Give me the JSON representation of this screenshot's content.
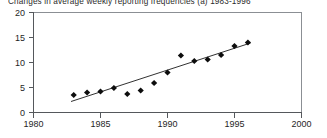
{
  "chart_data": {
    "type": "scatter",
    "title": "Changes in average weekly reporting frequencies (a) 1983-1996",
    "xlabel": "",
    "ylabel": "",
    "xlim": [
      1980,
      2000
    ],
    "ylim": [
      0,
      20
    ],
    "x_ticks": [
      1980,
      1985,
      1990,
      1995,
      2000
    ],
    "y_ticks": [
      0,
      5,
      10,
      15,
      20
    ],
    "grid": false,
    "legend": null,
    "series": [
      {
        "name": "Average weekly reporting frequency",
        "marker": "diamond",
        "color": "#0d0d0d",
        "x": [
          1983,
          1984,
          1985,
          1986,
          1987,
          1988,
          1989,
          1990,
          1991,
          1992,
          1993,
          1994,
          1995,
          1996
        ],
        "values": [
          3.5,
          4.0,
          4.2,
          4.9,
          3.7,
          4.4,
          5.9,
          8.0,
          11.4,
          10.3,
          10.6,
          11.5,
          13.3,
          14.0
        ]
      },
      {
        "name": "Linear trend",
        "type": "line",
        "color": "#1a1a1a",
        "x": [
          1982.8,
          1996.2
        ],
        "values": [
          2.2,
          13.9
        ]
      }
    ]
  },
  "axes": {
    "y_tick_labels": [
      "20",
      "15",
      "10",
      "5",
      "0"
    ],
    "x_tick_labels": [
      "1980",
      "1985",
      "1990",
      "1995",
      "2000"
    ]
  }
}
